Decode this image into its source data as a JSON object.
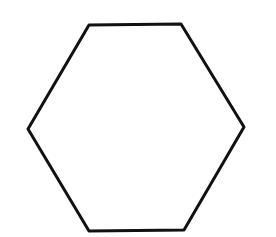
{
  "canvas": {
    "width": 276,
    "height": 237,
    "background": "#ffffff"
  },
  "shape": {
    "type": "hexagon",
    "points": "89,25 181,24 244,127 184,230 89,231 28,129",
    "stroke": "#111111",
    "stroke_width": 3,
    "fill": "none"
  }
}
